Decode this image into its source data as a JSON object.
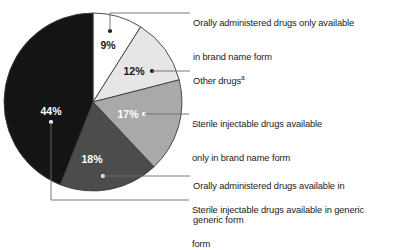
{
  "chart_data": {
    "type": "pie",
    "title": "",
    "categories": [
      "Orally administered drugs only available in brand name form",
      "Other drugs",
      "Sterile injectable drugs available only in brand name form",
      "Orally administered drugs available in generic form",
      "Sterile injectable drugs available in generic form"
    ],
    "values": [
      9,
      12,
      17,
      18,
      44
    ],
    "value_labels": [
      "9%",
      "12%",
      "17%",
      "18%",
      "44%"
    ],
    "unit": "percent",
    "start_angle_deg": 0,
    "direction": "clockwise",
    "legend": "callout-labels",
    "grid": false,
    "colors": [
      "#ffffff",
      "#e6e6e6",
      "#a9a9a9",
      "#4c4c4c",
      "#141414"
    ],
    "slice_text_colors": [
      "#1a1a1a",
      "#1a1a1a",
      "#ffffff",
      "#ffffff",
      "#ffffff"
    ]
  },
  "slices": [
    {
      "id": "oral-brand-only",
      "percent_label": "9%",
      "label_line1": "Orally administered drugs only available",
      "label_line2": "in brand name form",
      "footnote_marker": ""
    },
    {
      "id": "other-drugs",
      "percent_label": "12%",
      "label_line1": "Other drugs",
      "label_line2": "",
      "footnote_marker": "a"
    },
    {
      "id": "sterile-brand-only",
      "percent_label": "17%",
      "label_line1": "Sterile injectable drugs available",
      "label_line2": "only in brand name form",
      "footnote_marker": ""
    },
    {
      "id": "oral-generic",
      "percent_label": "18%",
      "label_line1": "Orally administered drugs available in",
      "label_line2": "generic form",
      "footnote_marker": ""
    },
    {
      "id": "sterile-generic",
      "percent_label": "44%",
      "label_line1": "Sterile injectable drugs available in generic",
      "label_line2": "form",
      "footnote_marker": ""
    }
  ]
}
